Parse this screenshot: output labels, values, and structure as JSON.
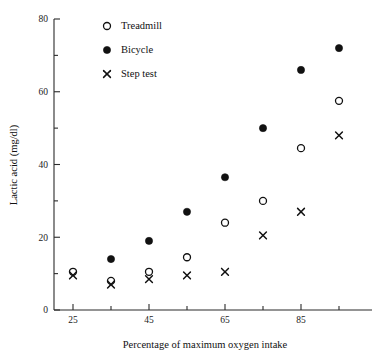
{
  "chart_data": {
    "type": "scatter",
    "title": "",
    "xlabel": "Percentage of maximum oxygen intake",
    "ylabel": "Lactic acid (mg/dl)",
    "xlim": [
      20,
      100
    ],
    "ylim": [
      0,
      80
    ],
    "grid": false,
    "legend_position": "top-left-inside",
    "x_ticks_major": [
      25,
      45,
      65,
      85
    ],
    "x_ticks_major_labels": [
      "25",
      "45",
      "65",
      "85"
    ],
    "x_ticks_minor": [
      35,
      55,
      75,
      95
    ],
    "y_ticks_major": [
      0,
      20,
      40,
      60,
      80
    ],
    "y_ticks_major_labels": [
      "0",
      "20",
      "40",
      "60",
      "80"
    ],
    "y_ticks_minor": [
      10,
      30,
      50,
      70
    ],
    "x": [
      25,
      35,
      45,
      55,
      65,
      75,
      85,
      95
    ],
    "series": [
      {
        "name": "Treadmill",
        "marker": "open-circle",
        "color": "#111111",
        "values": [
          10.5,
          8.0,
          10.5,
          14.5,
          24.0,
          30.0,
          44.5,
          57.5
        ]
      },
      {
        "name": "Bicycle",
        "marker": "filled-circle",
        "color": "#111111",
        "values": [
          null,
          14.0,
          19.0,
          27.0,
          36.5,
          50.0,
          66.0,
          72.0
        ]
      },
      {
        "name": "Step test",
        "marker": "cross",
        "color": "#111111",
        "values": [
          9.5,
          7.0,
          8.5,
          9.5,
          10.5,
          20.5,
          27.0,
          48.0
        ]
      }
    ]
  },
  "legend": {
    "items": [
      {
        "label": "Treadmill",
        "marker": "open-circle"
      },
      {
        "label": "Bicycle",
        "marker": "filled-circle"
      },
      {
        "label": "Step test",
        "marker": "cross"
      }
    ]
  },
  "axes": {
    "x_title": "Percentage of maximum oxygen intake",
    "y_title": "Lactic acid (mg/dl)"
  }
}
